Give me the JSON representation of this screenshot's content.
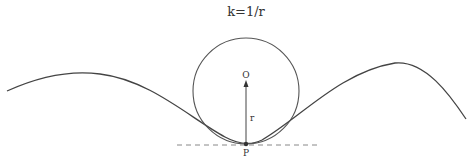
{
  "title": "k=1/r",
  "labels": {
    "center": "O",
    "radius": "r",
    "point": "P"
  },
  "colors": {
    "stroke": "#444444",
    "dashed": "#888888"
  }
}
